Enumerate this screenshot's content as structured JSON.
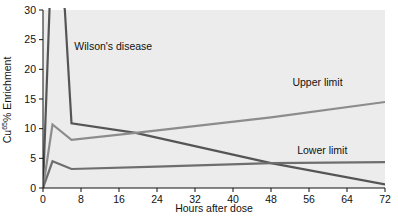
{
  "chart_data": {
    "type": "line",
    "title": "",
    "xlabel": "Hours after dose",
    "ylabel": "Cu65% Enrichment",
    "ylabel_base": "Cu",
    "ylabel_superscript": "65",
    "ylabel_rest": "% Enrichment",
    "xlim": [
      0,
      72
    ],
    "ylim": [
      0,
      30
    ],
    "xticks": [
      0,
      8,
      16,
      24,
      32,
      40,
      48,
      56,
      64,
      72
    ],
    "xtick_labels": [
      "0",
      "8",
      "16",
      "24",
      "32",
      "40",
      "48",
      "56",
      "64",
      "72"
    ],
    "yticks": [
      0,
      5,
      10,
      15,
      20,
      25,
      30
    ],
    "ytick_labels": [
      "0",
      "5",
      "10",
      "15",
      "20",
      "25",
      "30"
    ],
    "grid": false,
    "legend_position": "inline-annotations",
    "plot_background": "#ececec",
    "series": [
      {
        "name": "Wilson's disease",
        "color": "#555555",
        "label_x": 6.6,
        "label_y": 23.2,
        "x": [
          0,
          2,
          4.6,
          6,
          19.5,
          48,
          72
        ],
        "y": [
          0,
          44,
          30,
          10.9,
          9.3,
          4.2,
          0.6
        ]
      },
      {
        "name": "Upper limit",
        "color": "#8c8c8c",
        "label_x": 52.5,
        "label_y": 17.2,
        "x": [
          0,
          2,
          6,
          19.5,
          48,
          72
        ],
        "y": [
          0,
          10.7,
          8.1,
          9.3,
          11.9,
          14.5
        ]
      },
      {
        "name": "Lower limit",
        "color": "#6e6e6e",
        "label_x": 53.5,
        "label_y": 5.7,
        "x": [
          0,
          2,
          6,
          24,
          48,
          72
        ],
        "y": [
          0,
          4.5,
          3.2,
          3.6,
          4.2,
          4.35
        ]
      }
    ]
  },
  "annotations": {
    "wilson_label": "Wilson's disease",
    "upper_label": "Upper limit",
    "lower_label": "Lower limit"
  },
  "axes": {
    "x_title": "Hours after dose",
    "y_title_base": "Cu",
    "y_title_sup": "65",
    "y_title_rest": "% Enrichment"
  }
}
